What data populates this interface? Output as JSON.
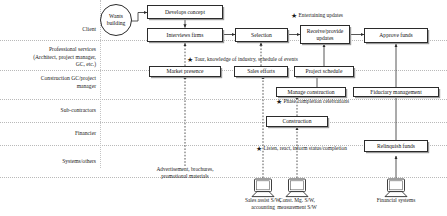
{
  "diagram": {
    "lanes": [
      {
        "id": "client",
        "label": "Client"
      },
      {
        "id": "professional-services",
        "label": "Professional services\n(Architect, project manager,\nGC, etc.)"
      },
      {
        "id": "construction-gc",
        "label": "Construction GC/project\nmanager"
      },
      {
        "id": "sub-contractors",
        "label": "Sub-contractors"
      },
      {
        "id": "financier",
        "label": "Financier"
      },
      {
        "id": "systems-others",
        "label": "Systems/others"
      }
    ],
    "start_node": {
      "id": "wants-building",
      "label": "Wants\nbuilding"
    },
    "nodes": [
      {
        "id": "develops-concept",
        "label": "Develops concept",
        "lane": "client"
      },
      {
        "id": "interviews-firms",
        "label": "Interviews firms",
        "lane": "client"
      },
      {
        "id": "selection",
        "label": "Selection",
        "lane": "client"
      },
      {
        "id": "receive-provide-updates",
        "label": "Receive/provide\nupdates",
        "lane": "client"
      },
      {
        "id": "approve-funds",
        "label": "Approve funds",
        "lane": "client"
      },
      {
        "id": "market-presence",
        "label": "Market presence",
        "lane": "professional-services"
      },
      {
        "id": "sales-efforts",
        "label": "Sales efforts",
        "lane": "professional-services"
      },
      {
        "id": "project-schedule",
        "label": "Project schedule",
        "lane": "professional-services"
      },
      {
        "id": "manage-construction",
        "label": "Manage construction",
        "lane": "construction-gc"
      },
      {
        "id": "fiduciary-management",
        "label": "Fiduciary management",
        "lane": "construction-gc"
      },
      {
        "id": "construction",
        "label": "Construction",
        "lane": "sub-contractors"
      },
      {
        "id": "relinquish-funds",
        "label": "Relinquish funds",
        "lane": "financier"
      }
    ],
    "annotations": [
      {
        "id": "entertaining-updates",
        "text": "Entertaining updates"
      },
      {
        "id": "tour-knowledge",
        "text": "Tour, knowledge of industry, schedule of events"
      },
      {
        "id": "phase-completion",
        "text": "Phase completion celebrations"
      },
      {
        "id": "listen-react",
        "text": "Listen, react, inform status/completion"
      }
    ],
    "systems": [
      {
        "id": "advertisement",
        "label": "Advertisement, brochures,\npromotional materials",
        "icon": "none"
      },
      {
        "id": "sales-assist",
        "label": "Sales assist S/W,\naccounting",
        "icon": "computer-icon"
      },
      {
        "id": "const-mg",
        "label": "Const. Mg. S/W,\nmeasurement S/W",
        "icon": "computer-icon"
      },
      {
        "id": "financial-systems",
        "label": "Financial systems",
        "icon": "computer-icon"
      }
    ],
    "star_glyph": "★",
    "colors": {
      "line": "#2b2b2b",
      "lane_sep": "#b9b9b9",
      "text": "#1b1b1b",
      "background": "#ffffff"
    }
  }
}
